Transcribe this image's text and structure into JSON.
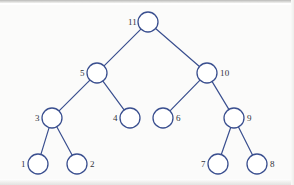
{
  "figure": {
    "type": "binary-tree-diagram",
    "stroke_color": "#3a4f8f",
    "node_fill": "#ffffff",
    "label_color": "#30323a",
    "background_color": "#fbfbfa",
    "node_radius": 10
  },
  "nodes": [
    {
      "id": "n11",
      "label": "11",
      "cx": 148,
      "cy": 22,
      "label_x": 128,
      "label_y": 17,
      "label_side": "left"
    },
    {
      "id": "n5",
      "label": "5",
      "cx": 97,
      "cy": 73,
      "label_x": 80,
      "label_y": 68,
      "label_side": "left"
    },
    {
      "id": "n10",
      "label": "10",
      "cx": 207,
      "cy": 73,
      "label_x": 220,
      "label_y": 68,
      "label_side": "right"
    },
    {
      "id": "n3",
      "label": "3",
      "cx": 52,
      "cy": 118,
      "label_x": 35,
      "label_y": 113,
      "label_side": "left"
    },
    {
      "id": "n4",
      "label": "4",
      "cx": 130,
      "cy": 118,
      "label_x": 113,
      "label_y": 113,
      "label_side": "left"
    },
    {
      "id": "n6",
      "label": "6",
      "cx": 163,
      "cy": 118,
      "label_x": 176,
      "label_y": 113,
      "label_side": "right"
    },
    {
      "id": "n9",
      "label": "9",
      "cx": 234,
      "cy": 118,
      "label_x": 247,
      "label_y": 113,
      "label_side": "right"
    },
    {
      "id": "n1",
      "label": "1",
      "cx": 38,
      "cy": 164,
      "label_x": 21,
      "label_y": 159,
      "label_side": "left"
    },
    {
      "id": "n2",
      "label": "2",
      "cx": 77,
      "cy": 164,
      "label_x": 90,
      "label_y": 159,
      "label_side": "right"
    },
    {
      "id": "n7",
      "label": "7",
      "cx": 218,
      "cy": 164,
      "label_x": 201,
      "label_y": 159,
      "label_side": "left"
    },
    {
      "id": "n8",
      "label": "8",
      "cx": 257,
      "cy": 164,
      "label_x": 270,
      "label_y": 159,
      "label_side": "right"
    }
  ],
  "edges": [
    {
      "from": "n11",
      "to": "n5"
    },
    {
      "from": "n11",
      "to": "n10"
    },
    {
      "from": "n5",
      "to": "n3"
    },
    {
      "from": "n5",
      "to": "n4"
    },
    {
      "from": "n10",
      "to": "n6"
    },
    {
      "from": "n10",
      "to": "n9"
    },
    {
      "from": "n3",
      "to": "n1"
    },
    {
      "from": "n3",
      "to": "n2"
    },
    {
      "from": "n9",
      "to": "n7"
    },
    {
      "from": "n9",
      "to": "n8"
    }
  ]
}
